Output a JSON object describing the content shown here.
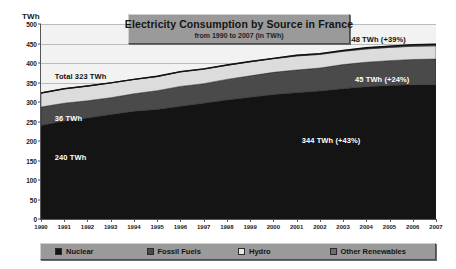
{
  "chart_data": {
    "type": "area",
    "title": "Electricity Consumption by Source in France",
    "subtitle": "from 1990 to 2007 (in TWh)",
    "xlabel": "",
    "ylabel": "TWh",
    "unit_label": "TWh",
    "ylim": [
      0,
      500
    ],
    "ytick_step": 50,
    "grid": true,
    "stacked": true,
    "legend_position": "bottom",
    "categories": [
      "1990",
      "1991",
      "1992",
      "1993",
      "1994",
      "1995",
      "1996",
      "1997",
      "1998",
      "1999",
      "2000",
      "2001",
      "2002",
      "2003",
      "2004",
      "2005",
      "2006",
      "2007"
    ],
    "yticks": [
      "0",
      "50",
      "100",
      "150",
      "200",
      "250",
      "300",
      "350",
      "400",
      "450",
      "500"
    ],
    "series": [
      {
        "name": "Nuclear",
        "color": "#141414",
        "values": [
          240,
          251,
          259,
          268,
          276,
          281,
          289,
          297,
          305,
          312,
          319,
          324,
          328,
          334,
          339,
          342,
          344,
          344
        ]
      },
      {
        "name": "Fossil Fuels",
        "color": "#4a4a4a",
        "values": [
          47,
          46,
          44,
          43,
          45,
          48,
          51,
          50,
          53,
          55,
          57,
          58,
          59,
          62,
          63,
          64,
          65,
          66
        ]
      },
      {
        "name": "Hydro",
        "color": "#dcdcdc",
        "values": [
          36,
          37,
          38,
          38,
          37,
          36,
          37,
          37,
          36,
          36,
          35,
          36,
          35,
          34,
          34,
          34,
          34,
          34
        ]
      },
      {
        "name": "Other Renewables",
        "color": "#3a3a3a",
        "values": [
          0,
          0,
          0,
          0,
          0,
          1,
          1,
          1,
          1,
          1,
          1,
          2,
          2,
          2,
          3,
          3,
          4,
          4
        ]
      }
    ],
    "total_line": {
      "name": "Total",
      "color": "#111111",
      "values": [
        323,
        334,
        341,
        349,
        358,
        366,
        378,
        385,
        395,
        404,
        412,
        420,
        424,
        432,
        439,
        443,
        447,
        448
      ]
    },
    "annotations": [
      {
        "id": "total-start",
        "text": "Total  323 TWh",
        "x_pct": 3.5,
        "y_value": 378,
        "tone": "dark"
      },
      {
        "id": "hydro-start",
        "text": "36 TWh",
        "x_pct": 3.5,
        "y_value": 268,
        "tone": "light"
      },
      {
        "id": "nuclear-start",
        "text": "240 TWh",
        "x_pct": 3.5,
        "y_value": 170,
        "tone": "light"
      },
      {
        "id": "total-end",
        "text": "448 TWh (+39%)",
        "x_pct": 77.5,
        "y_value": 473,
        "tone": "dark"
      },
      {
        "id": "hydro-end",
        "text": "45 TWh (+24%)",
        "x_pct": 79.5,
        "y_value": 368,
        "tone": "light"
      },
      {
        "id": "nuclear-end",
        "text": "344 TWh (+43%)",
        "x_pct": 66.0,
        "y_value": 212,
        "tone": "light"
      }
    ]
  },
  "legend": {
    "items": [
      {
        "label": "Nuclear",
        "color": "#141414"
      },
      {
        "label": "Fossil Fuels",
        "color": "#4a4a4a"
      },
      {
        "label": "Hydro",
        "color": "#e8e8e8"
      },
      {
        "label": "Other Renewables",
        "color": "#6e6e6e"
      }
    ]
  }
}
